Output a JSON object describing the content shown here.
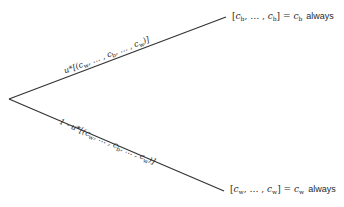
{
  "diagram": {
    "type": "decision-tree",
    "root": {
      "x": 9,
      "y": 99
    },
    "branches": [
      {
        "id": "upper",
        "end": {
          "x": 226,
          "y": 17
        },
        "probability_label": {
          "prefix": "u*",
          "open": "[(",
          "terms": [
            "c",
            "w",
            ", … , ",
            "c",
            "b",
            ", … , ",
            "c",
            "w"
          ],
          "close": ")]"
        },
        "outcome": {
          "lottery_open": "[",
          "first": "c",
          "first_sub": "b",
          "mid": ", … , ",
          "last": "c",
          "last_sub": "b",
          "lottery_close": "] = ",
          "result": "c",
          "result_sub": "b",
          "word": "always"
        }
      },
      {
        "id": "lower",
        "end": {
          "x": 224,
          "y": 191
        },
        "probability_label": {
          "prefix": "1 - u*",
          "open": "[(",
          "terms": [
            "c",
            "w",
            ", … , ",
            "c",
            "b",
            ", … , ",
            "c",
            "w"
          ],
          "close": ")]"
        },
        "outcome": {
          "lottery_open": "[",
          "first": "c",
          "first_sub": "w",
          "mid": ", … , ",
          "last": "c",
          "last_sub": "w",
          "lottery_close": "] = ",
          "result": "c",
          "result_sub": "w",
          "word": "always"
        }
      }
    ],
    "line_color": "#333333"
  }
}
